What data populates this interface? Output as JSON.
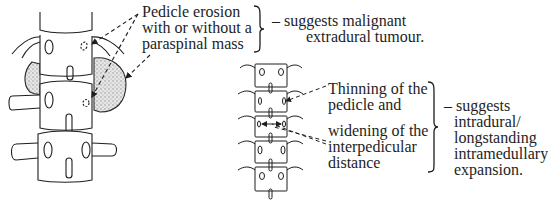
{
  "figure": {
    "type": "medical-diagram"
  },
  "panel_extradural": {
    "finding_lines": [
      "Pedicle erosion",
      "with or without a",
      "paraspinal mass"
    ],
    "interpretation_lines": [
      "– suggests malignant",
      "extradural tumour."
    ],
    "illustration": "lumbar-vertebrae-with-paraspinal-mass-icon"
  },
  "panel_intradural": {
    "finding_a_lines": [
      "Thinning of the",
      "pedicle and"
    ],
    "finding_b_lines": [
      "widening of the",
      "interpedicular",
      "distance"
    ],
    "interpretation_lines": [
      "– suggests",
      "intradural/",
      "longstanding",
      "intramedullary",
      "expansion."
    ],
    "illustration": "vertebral-column-ap-view-icon"
  },
  "colors": {
    "ink": "#1e1e1e",
    "mass_shading": "#b8b8b8",
    "background": "#ffffff"
  }
}
